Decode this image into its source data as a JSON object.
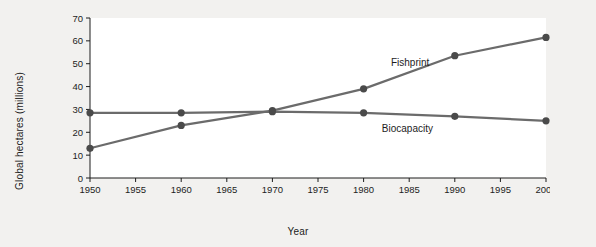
{
  "chart_data": {
    "type": "line",
    "title": "",
    "xlabel": "Year",
    "ylabel": "Global hectares (millions)",
    "xlim": [
      1950,
      2000
    ],
    "ylim": [
      0,
      70
    ],
    "x_ticks": [
      1950,
      1955,
      1960,
      1965,
      1970,
      1975,
      1980,
      1985,
      1990,
      1995,
      2000
    ],
    "y_ticks": [
      0,
      10,
      20,
      30,
      40,
      50,
      60,
      70
    ],
    "grid": false,
    "legend_position": "inline-annotation",
    "x": [
      1950,
      1960,
      1970,
      1980,
      1990,
      2000
    ],
    "series": [
      {
        "name": "Fishprint",
        "label": "Fishprint",
        "color": "#6b6b6b",
        "values": [
          13,
          23,
          29.5,
          39,
          53.5,
          61.5
        ],
        "label_x": 1983,
        "label_y": 49
      },
      {
        "name": "Biocapacity",
        "label": "Biocapacity",
        "color": "#6b6b6b",
        "values": [
          28.5,
          28.5,
          29,
          28.5,
          27,
          25
        ],
        "label_x": 1982,
        "label_y": 20
      }
    ]
  },
  "colors": {
    "background": "#f2f1ef",
    "plot_background": "#ffffff",
    "line": "#6b6b6b",
    "marker": "#4a4a4a",
    "axis": "#1d1d1d",
    "text": "#1d1d1d"
  }
}
